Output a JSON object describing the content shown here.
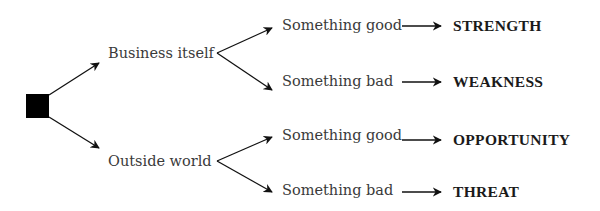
{
  "diagram": {
    "root": {
      "shape": "square",
      "color": "#000000"
    },
    "branches": [
      {
        "label": "Business itself",
        "children": [
          {
            "label": "Something good",
            "result": "STRENGTH"
          },
          {
            "label": "Something bad",
            "result": "WEAKNESS"
          }
        ]
      },
      {
        "label": "Outside world",
        "children": [
          {
            "label": "Something good",
            "result": "OPPORTUNITY"
          },
          {
            "label": "Something bad",
            "result": "THREAT"
          }
        ]
      }
    ]
  }
}
